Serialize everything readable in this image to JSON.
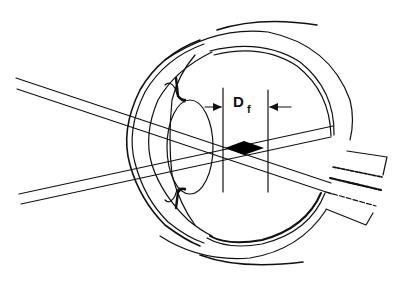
{
  "diagram": {
    "label": {
      "main": "D",
      "subscript": "f"
    },
    "colors": {
      "background": "#ffffff",
      "line": "#111111",
      "focus_region": "#000000"
    },
    "elements": [
      "cornea",
      "sclera",
      "iris",
      "ciliary-body",
      "lens",
      "retina",
      "optic-nerve",
      "upper-light-ray-pair",
      "lower-light-ray-pair",
      "depth-of-focus-markers",
      "focus-diamond"
    ]
  }
}
